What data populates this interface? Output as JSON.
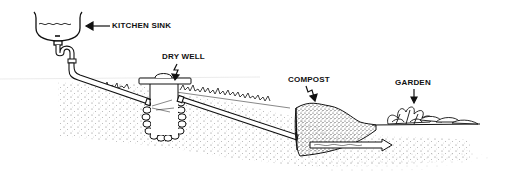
{
  "diagram": {
    "type": "greywater-system-illustration",
    "labels": {
      "kitchen_sink": "KITCHEN SINK",
      "dry_well": "DRY WELL",
      "compost": "COMPOST",
      "garden": "GARDEN"
    },
    "components": [
      {
        "id": "kitchen-sink",
        "label": "KITCHEN SINK"
      },
      {
        "id": "dry-well",
        "label": "DRY WELL"
      },
      {
        "id": "compost",
        "label": "COMPOST"
      },
      {
        "id": "garden",
        "label": "GARDEN"
      }
    ],
    "flow": [
      "KITCHEN SINK",
      "DRY WELL",
      "COMPOST",
      "GARDEN"
    ],
    "colors": {
      "ink": "#111111",
      "background": "#ffffff",
      "soil_stipple": "#555555"
    }
  }
}
